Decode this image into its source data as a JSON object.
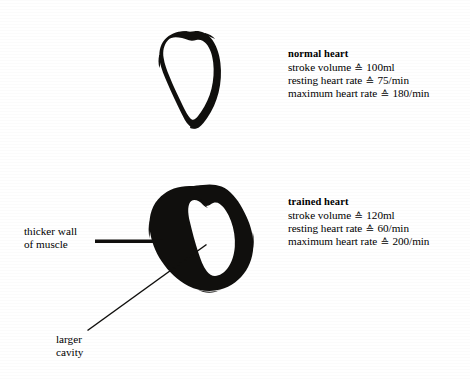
{
  "figure": {
    "background_color": "#ffffff",
    "ink_color": "#100f0d"
  },
  "diagrams": [
    {
      "id": "normal-heart",
      "name": "normal heart cross-section",
      "wall": "thin"
    },
    {
      "id": "trained-heart",
      "name": "trained heart cross-section",
      "wall": "thick"
    }
  ],
  "stats": {
    "normal": {
      "title": "normal heart",
      "rows": [
        {
          "label": "stroke volume",
          "symbol": "≙",
          "value": "100ml"
        },
        {
          "label": "resting heart rate",
          "symbol": "≙",
          "value": "75/min"
        },
        {
          "label": "maximum heart rate",
          "symbol": "≙",
          "value": "180/min"
        }
      ]
    },
    "trained": {
      "title": "trained heart",
      "rows": [
        {
          "label": "stroke volume",
          "symbol": "≙",
          "value": "120ml"
        },
        {
          "label": "resting heart rate",
          "symbol": "≙",
          "value": "60/min"
        },
        {
          "label": "maximum heart rate",
          "symbol": "≙",
          "value": "200/min"
        }
      ]
    }
  },
  "callouts": {
    "thicker_wall": {
      "line1": "thicker wall",
      "line2": "of muscle",
      "leader": "thick-horizontal"
    },
    "larger_cavity": {
      "line1": "larger",
      "line2": "cavity",
      "leader": "thin-diagonal"
    }
  }
}
